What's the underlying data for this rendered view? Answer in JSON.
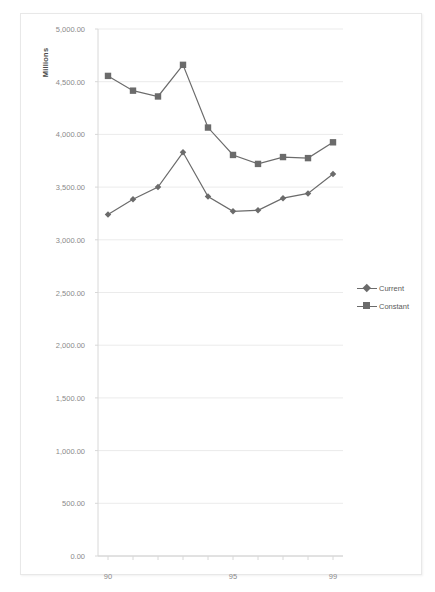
{
  "chart_data": {
    "type": "line",
    "title": "",
    "subtitle": "",
    "xlabel": "",
    "ylabel": "Millions",
    "x": [
      90,
      91,
      92,
      93,
      94,
      95,
      96,
      97,
      98,
      99
    ],
    "categories": [
      "90",
      "91",
      "92",
      "93",
      "94",
      "95",
      "96",
      "97",
      "98",
      "99"
    ],
    "x_tick_labels": [
      "90",
      "95",
      "99"
    ],
    "x_tick_values": [
      90,
      95,
      99
    ],
    "xlim": [
      89.6,
      99.4
    ],
    "ylim": [
      0,
      5000
    ],
    "y_ticks": [
      0,
      500,
      1000,
      1500,
      2000,
      2500,
      3000,
      3500,
      4000,
      4500,
      5000
    ],
    "y_tick_labels": [
      "0.00",
      "500.00",
      "1,000.00",
      "1,500.00",
      "2,000.00",
      "2,500.00",
      "3,000.00",
      "3,500.00",
      "4,000.00",
      "4,500.00",
      "5,000.00"
    ],
    "grid": true,
    "grid_axis": "y",
    "legend_position": "right",
    "series": [
      {
        "name": "Current",
        "marker": "diamond",
        "color": "#6b6b6b",
        "values": [
          3240,
          3385,
          3500,
          3830,
          3410,
          3270,
          3280,
          3395,
          3440,
          3625
        ]
      },
      {
        "name": "Constant",
        "marker": "square",
        "color": "#6b6b6b",
        "values": [
          4555,
          4415,
          4360,
          4660,
          4065,
          3805,
          3720,
          3785,
          3775,
          3925
        ]
      }
    ]
  },
  "legend": {
    "items": [
      {
        "label": "Current"
      },
      {
        "label": "Constant"
      }
    ]
  },
  "colors": {
    "series_gray": "#6b6b6b",
    "grid": "#ebebeb",
    "axis": "#d8d8d8",
    "tick_text": "#8a8a8a",
    "title_text": "#4a4a4a",
    "frame_border": "#e8e8e8",
    "background": "#ffffff"
  }
}
